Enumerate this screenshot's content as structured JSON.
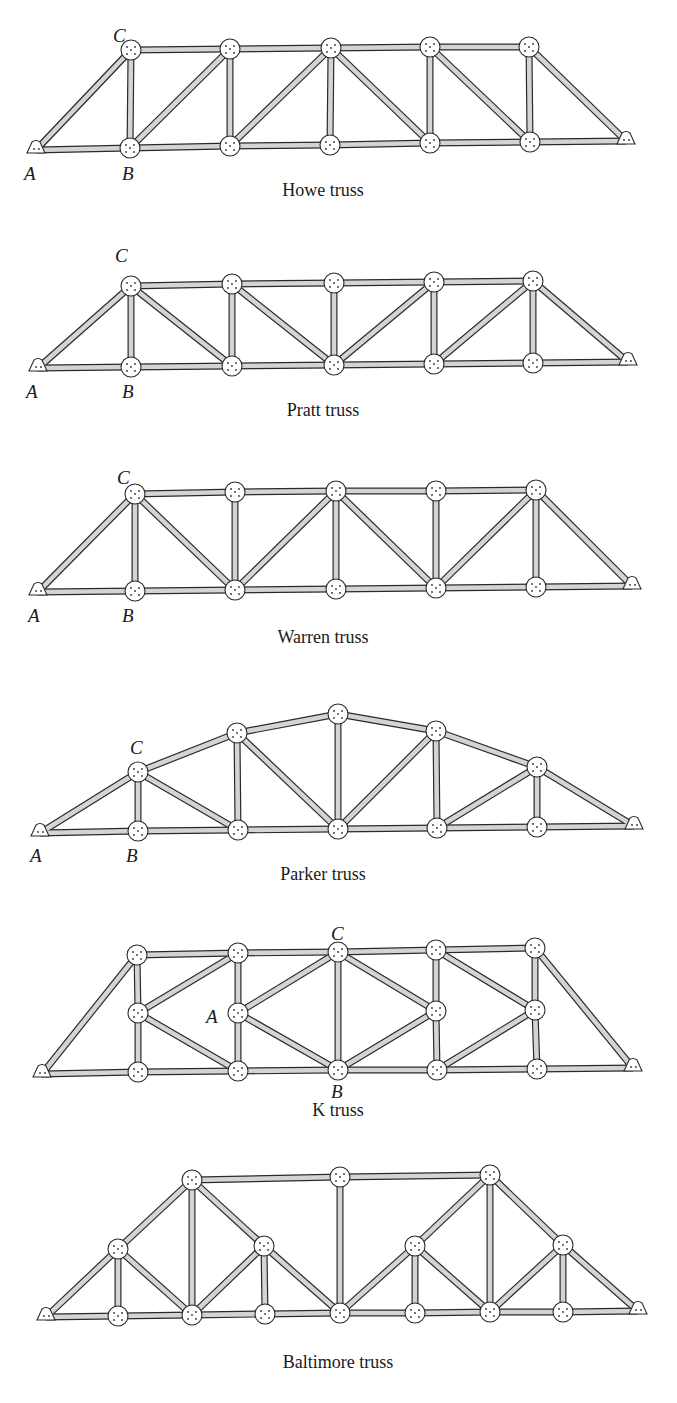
{
  "figure": {
    "member_style": {
      "outline": "#2a2a2a",
      "fill": "#d4d4d4",
      "width": 7
    },
    "gusset_style": {
      "fill": "#ffffff",
      "outline": "#2a2a2a"
    },
    "trusses": [
      {
        "id": "howe",
        "caption": "Howe truss",
        "caption_pos": [
          323,
          196
        ],
        "nodes": {
          "A": [
            36,
            150
          ],
          "b1": [
            130,
            148
          ],
          "b2": [
            230,
            146
          ],
          "b3": [
            330,
            145
          ],
          "b4": [
            430,
            143
          ],
          "b5": [
            530,
            142
          ],
          "E": [
            626,
            141
          ],
          "C": [
            131,
            50
          ],
          "t2": [
            230,
            49
          ],
          "t3": [
            331,
            48
          ],
          "t4": [
            430,
            47
          ],
          "t5": [
            529,
            47
          ]
        },
        "members": [
          [
            "A",
            "b1"
          ],
          [
            "b1",
            "b2"
          ],
          [
            "b2",
            "b3"
          ],
          [
            "b3",
            "b4"
          ],
          [
            "b4",
            "b5"
          ],
          [
            "b5",
            "E"
          ],
          [
            "C",
            "t2"
          ],
          [
            "t2",
            "t3"
          ],
          [
            "t3",
            "t4"
          ],
          [
            "t4",
            "t5"
          ],
          [
            "A",
            "C"
          ],
          [
            "t5",
            "E"
          ],
          [
            "b1",
            "C"
          ],
          [
            "b2",
            "t2"
          ],
          [
            "b3",
            "t3"
          ],
          [
            "b4",
            "t4"
          ],
          [
            "b5",
            "t5"
          ],
          [
            "b1",
            "t2"
          ],
          [
            "b2",
            "t3"
          ],
          [
            "t3",
            "b4"
          ],
          [
            "t4",
            "b5"
          ]
        ],
        "labels": [
          {
            "text": "A",
            "pos": [
              24,
              180
            ]
          },
          {
            "text": "B",
            "pos": [
              122,
              180
            ]
          },
          {
            "text": "C",
            "pos": [
              113,
              42
            ]
          }
        ]
      },
      {
        "id": "pratt",
        "caption": "Pratt truss",
        "caption_pos": [
          323,
          416
        ],
        "nodes": {
          "A": [
            38,
            368
          ],
          "b1": [
            131,
            367
          ],
          "b2": [
            232,
            366
          ],
          "b3": [
            334,
            365
          ],
          "b4": [
            434,
            364
          ],
          "b5": [
            533,
            363
          ],
          "E": [
            628,
            362
          ],
          "C": [
            131,
            286
          ],
          "t2": [
            232,
            284
          ],
          "t3": [
            334,
            283
          ],
          "t4": [
            434,
            282
          ],
          "t5": [
            533,
            281
          ]
        },
        "members": [
          [
            "A",
            "b1"
          ],
          [
            "b1",
            "b2"
          ],
          [
            "b2",
            "b3"
          ],
          [
            "b3",
            "b4"
          ],
          [
            "b4",
            "b5"
          ],
          [
            "b5",
            "E"
          ],
          [
            "C",
            "t2"
          ],
          [
            "t2",
            "t3"
          ],
          [
            "t3",
            "t4"
          ],
          [
            "t4",
            "t5"
          ],
          [
            "A",
            "C"
          ],
          [
            "t5",
            "E"
          ],
          [
            "b1",
            "C"
          ],
          [
            "b2",
            "t2"
          ],
          [
            "b3",
            "t3"
          ],
          [
            "b4",
            "t4"
          ],
          [
            "b5",
            "t5"
          ],
          [
            "C",
            "b2"
          ],
          [
            "t2",
            "b3"
          ],
          [
            "b3",
            "t4"
          ],
          [
            "b4",
            "t5"
          ]
        ],
        "labels": [
          {
            "text": "A",
            "pos": [
              26,
              398
            ]
          },
          {
            "text": "B",
            "pos": [
              122,
              398
            ]
          },
          {
            "text": "C",
            "pos": [
              115,
              262
            ]
          }
        ]
      },
      {
        "id": "warren",
        "caption": "Warren truss",
        "caption_pos": [
          323,
          643
        ],
        "nodes": {
          "A": [
            38,
            592
          ],
          "b1": [
            135,
            591
          ],
          "b2": [
            235,
            590
          ],
          "b3": [
            336,
            589
          ],
          "b4": [
            436,
            588
          ],
          "b5": [
            536,
            587
          ],
          "E": [
            632,
            586
          ],
          "C": [
            135,
            494
          ],
          "t2": [
            235,
            492
          ],
          "t3": [
            336,
            491
          ],
          "t4": [
            436,
            491
          ],
          "t5": [
            536,
            490
          ]
        },
        "members": [
          [
            "A",
            "b1"
          ],
          [
            "b1",
            "b2"
          ],
          [
            "b2",
            "b3"
          ],
          [
            "b3",
            "b4"
          ],
          [
            "b4",
            "b5"
          ],
          [
            "b5",
            "E"
          ],
          [
            "C",
            "t2"
          ],
          [
            "t2",
            "t3"
          ],
          [
            "t3",
            "t4"
          ],
          [
            "t4",
            "t5"
          ],
          [
            "A",
            "C"
          ],
          [
            "t5",
            "E"
          ],
          [
            "b1",
            "C"
          ],
          [
            "b2",
            "t2"
          ],
          [
            "b3",
            "t3"
          ],
          [
            "b4",
            "t4"
          ],
          [
            "b5",
            "t5"
          ],
          [
            "C",
            "b2"
          ],
          [
            "b2",
            "t3"
          ],
          [
            "t3",
            "b4"
          ],
          [
            "b4",
            "t5"
          ]
        ],
        "labels": [
          {
            "text": "A",
            "pos": [
              28,
              622
            ]
          },
          {
            "text": "B",
            "pos": [
              122,
              622
            ]
          },
          {
            "text": "C",
            "pos": [
              117,
              484
            ]
          }
        ]
      },
      {
        "id": "parker",
        "caption": "Parker truss",
        "caption_pos": [
          323,
          880
        ],
        "nodes": {
          "A": [
            40,
            833
          ],
          "b1": [
            138,
            831
          ],
          "b2": [
            238,
            830
          ],
          "b3": [
            338,
            829
          ],
          "b4": [
            437,
            828
          ],
          "b5": [
            537,
            827
          ],
          "E": [
            634,
            826
          ],
          "C": [
            138,
            772
          ],
          "t2": [
            237,
            733
          ],
          "t3": [
            338,
            714
          ],
          "t4": [
            436,
            731
          ],
          "t5": [
            537,
            767
          ]
        },
        "members": [
          [
            "A",
            "b1"
          ],
          [
            "b1",
            "b2"
          ],
          [
            "b2",
            "b3"
          ],
          [
            "b3",
            "b4"
          ],
          [
            "b4",
            "b5"
          ],
          [
            "b5",
            "E"
          ],
          [
            "A",
            "C"
          ],
          [
            "C",
            "t2"
          ],
          [
            "t2",
            "t3"
          ],
          [
            "t3",
            "t4"
          ],
          [
            "t4",
            "t5"
          ],
          [
            "t5",
            "E"
          ],
          [
            "b1",
            "C"
          ],
          [
            "b2",
            "t2"
          ],
          [
            "b3",
            "t3"
          ],
          [
            "b4",
            "t4"
          ],
          [
            "b5",
            "t5"
          ],
          [
            "C",
            "b2"
          ],
          [
            "t2",
            "b3"
          ],
          [
            "b3",
            "t4"
          ],
          [
            "b4",
            "t5"
          ]
        ],
        "labels": [
          {
            "text": "A",
            "pos": [
              30,
              862
            ]
          },
          {
            "text": "B",
            "pos": [
              126,
              862
            ]
          },
          {
            "text": "C",
            "pos": [
              130,
              754
            ]
          }
        ]
      },
      {
        "id": "k",
        "caption": "K truss",
        "caption_pos": [
          338,
          1116
        ],
        "nodes": {
          "L": [
            42,
            1074
          ],
          "b1": [
            138,
            1072
          ],
          "b2": [
            238,
            1071
          ],
          "b3": [
            338,
            1070
          ],
          "b4": [
            437,
            1070
          ],
          "b5": [
            537,
            1069
          ],
          "R": [
            633,
            1068
          ],
          "t1": [
            137,
            955
          ],
          "t2": [
            238,
            953
          ],
          "t3": [
            338,
            952
          ],
          "t4": [
            436,
            950
          ],
          "t5": [
            535,
            948
          ],
          "m1": [
            138,
            1013
          ],
          "m2": [
            238,
            1013
          ],
          "m4": [
            436,
            1011
          ],
          "m5": [
            535,
            1010
          ]
        },
        "members": [
          [
            "L",
            "b1"
          ],
          [
            "b1",
            "b2"
          ],
          [
            "b2",
            "b3"
          ],
          [
            "b3",
            "b4"
          ],
          [
            "b4",
            "b5"
          ],
          [
            "b5",
            "R"
          ],
          [
            "t1",
            "t2"
          ],
          [
            "t2",
            "t3"
          ],
          [
            "t3",
            "t4"
          ],
          [
            "t4",
            "t5"
          ],
          [
            "L",
            "t1"
          ],
          [
            "t5",
            "R"
          ],
          [
            "b1",
            "m1"
          ],
          [
            "m1",
            "t1"
          ],
          [
            "b2",
            "m2"
          ],
          [
            "m2",
            "t2"
          ],
          [
            "b3",
            "t3"
          ],
          [
            "b4",
            "m4"
          ],
          [
            "m4",
            "t4"
          ],
          [
            "b5",
            "m5"
          ],
          [
            "m5",
            "t5"
          ],
          [
            "m1",
            "t2"
          ],
          [
            "m1",
            "b2"
          ],
          [
            "m2",
            "t3"
          ],
          [
            "m2",
            "b3"
          ],
          [
            "t3",
            "m4"
          ],
          [
            "b3",
            "m4"
          ],
          [
            "t4",
            "m5"
          ],
          [
            "b4",
            "m5"
          ]
        ],
        "labels": [
          {
            "text": "C",
            "pos": [
              331,
              940
            ]
          },
          {
            "text": "A",
            "pos": [
              206,
              1023
            ]
          },
          {
            "text": "B",
            "pos": [
              331,
              1098
            ]
          }
        ]
      },
      {
        "id": "baltimore",
        "caption": "Baltimore truss",
        "caption_pos": [
          338,
          1368
        ],
        "nodes": {
          "L": [
            46,
            1317
          ],
          "b1": [
            118,
            1316
          ],
          "b2": [
            192,
            1315
          ],
          "b3": [
            265,
            1314
          ],
          "b4": [
            340,
            1313
          ],
          "b5": [
            415,
            1313
          ],
          "b6": [
            490,
            1312
          ],
          "b7": [
            563,
            1312
          ],
          "R": [
            638,
            1311
          ],
          "m1": [
            118,
            1249
          ],
          "m3": [
            264,
            1246
          ],
          "m5": [
            415,
            1246
          ],
          "m7": [
            563,
            1245
          ],
          "t2": [
            192,
            1180
          ],
          "t4": [
            340,
            1177
          ],
          "t6": [
            490,
            1175
          ]
        },
        "members": [
          [
            "L",
            "b1"
          ],
          [
            "b1",
            "b2"
          ],
          [
            "b2",
            "b3"
          ],
          [
            "b3",
            "b4"
          ],
          [
            "b4",
            "b5"
          ],
          [
            "b5",
            "b6"
          ],
          [
            "b6",
            "b7"
          ],
          [
            "b7",
            "R"
          ],
          [
            "t2",
            "t4"
          ],
          [
            "t4",
            "t6"
          ],
          [
            "L",
            "m1"
          ],
          [
            "m1",
            "t2"
          ],
          [
            "t6",
            "m7"
          ],
          [
            "m7",
            "R"
          ],
          [
            "t2",
            "m3"
          ],
          [
            "m3",
            "b4"
          ],
          [
            "b4",
            "m5"
          ],
          [
            "m5",
            "t6"
          ],
          [
            "b1",
            "m1"
          ],
          [
            "b2",
            "t2"
          ],
          [
            "b3",
            "m3"
          ],
          [
            "b4",
            "t4"
          ],
          [
            "b5",
            "m5"
          ],
          [
            "b6",
            "t6"
          ],
          [
            "b7",
            "m7"
          ],
          [
            "m1",
            "b2"
          ],
          [
            "b2",
            "m3"
          ],
          [
            "m5",
            "b6"
          ],
          [
            "b6",
            "m7"
          ]
        ],
        "labels": []
      }
    ]
  }
}
